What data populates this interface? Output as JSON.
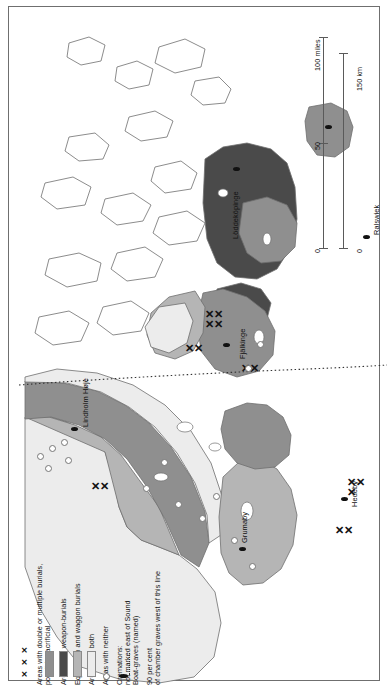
{
  "figure": {
    "type": "thematic-archaeological-map",
    "orientation": "rotated-90-ccw",
    "region": "Southern Scandinavia: Jutland, Danish islands, Scania"
  },
  "legend": {
    "title": "",
    "items": [
      {
        "key": "double-burials",
        "symbol": "xxx",
        "label": "Areas with double or multiple burials, possibly sacrificial"
      },
      {
        "key": "weapon-burials",
        "symbol": "swatch-weapon",
        "label": "Areas with weapon-burials",
        "color": "#8f8f8f"
      },
      {
        "key": "equestrian-waggon",
        "symbol": "swatch-eq",
        "label": "Equestrian and waggon burials",
        "color": "#4a4a4a"
      },
      {
        "key": "both",
        "symbol": "swatch-both",
        "label": "Areas with both",
        "color": "#b5b5b5"
      },
      {
        "key": "neither",
        "symbol": "swatch-neither",
        "label": "Areas with neither",
        "color": "#ececec"
      },
      {
        "key": "cremations",
        "symbol": "open-circle",
        "label": "Cremations: not marked east of Sound"
      },
      {
        "key": "boat-graves",
        "symbol": "filled-ellipse",
        "label": "Boat-graves (named)"
      },
      {
        "key": "chamber-line",
        "symbol": "dotted-line",
        "label": "90 per cent of chamber graves west of this line"
      }
    ]
  },
  "scale": {
    "miles": {
      "unit": "miles",
      "ticks": [
        "0",
        "50",
        "100"
      ],
      "label": "100 miles"
    },
    "km": {
      "unit": "km",
      "ticks": [
        "0",
        "150"
      ],
      "label": "150 km"
    }
  },
  "places": [
    {
      "name": "Lindholm Høje",
      "type": "boat-grave"
    },
    {
      "name": "Löddeköpinge",
      "type": "boat-grave"
    },
    {
      "name": "Fjälkinge",
      "type": "boat-grave"
    },
    {
      "name": "Hedeby",
      "type": "boat-grave"
    },
    {
      "name": "Grumaby",
      "type": "boat-grave"
    },
    {
      "name": "Ralswiek",
      "type": "boat-grave"
    }
  ],
  "colors": {
    "weapon": "#8f8f8f",
    "equestrian": "#4a4a4a",
    "both": "#b5b5b5",
    "neither": "#ececec",
    "sea": "#ffffff",
    "coast": "#6f6f6f",
    "ink": "#111111"
  }
}
